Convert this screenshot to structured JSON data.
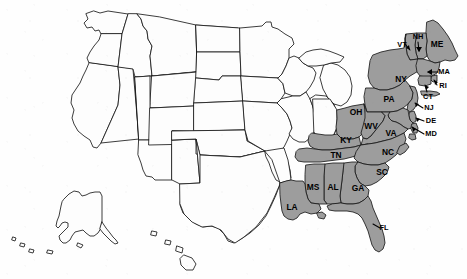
{
  "figure": {
    "kind": "us-states-choropleth-map",
    "width": 467,
    "height": 279,
    "background_color": "#fefefe",
    "shaded_fill_color": "#9d9d9d",
    "unshaded_fill_color": "#fdfdfd",
    "border_color": "#1a1a1a",
    "label_color": "#000000"
  },
  "chart_data": {
    "type": "map",
    "title": "",
    "subtitle": "",
    "xlabel": "",
    "ylabel": "",
    "legend": [],
    "categories": [
      "shaded",
      "unshaded"
    ],
    "shaded_count": 22,
    "labeled_states": [
      {
        "abbr": "ME",
        "label_x": 437,
        "label_y": 45,
        "value": 1
      },
      {
        "abbr": "NH",
        "label_x": 418,
        "label_y": 37,
        "value": 1
      },
      {
        "abbr": "VT",
        "label_x": 402,
        "label_y": 45,
        "value": 1
      },
      {
        "abbr": "MA",
        "label_x": 444,
        "label_y": 72,
        "value": 1
      },
      {
        "abbr": "RI",
        "label_x": 443,
        "label_y": 86,
        "value": 1
      },
      {
        "abbr": "CT",
        "label_x": 428,
        "label_y": 97,
        "value": 1
      },
      {
        "abbr": "NY",
        "label_x": 401,
        "label_y": 80,
        "value": 1
      },
      {
        "abbr": "NJ",
        "label_x": 429,
        "label_y": 108,
        "value": 1
      },
      {
        "abbr": "PA",
        "label_x": 389,
        "label_y": 100,
        "value": 1
      },
      {
        "abbr": "DE",
        "label_x": 431,
        "label_y": 121,
        "value": 1
      },
      {
        "abbr": "MD",
        "label_x": 431,
        "label_y": 134,
        "value": 1
      },
      {
        "abbr": "OH",
        "label_x": 356,
        "label_y": 113,
        "value": 1
      },
      {
        "abbr": "WV",
        "label_x": 371,
        "label_y": 127,
        "value": 1
      },
      {
        "abbr": "VA",
        "label_x": 391,
        "label_y": 134,
        "value": 1
      },
      {
        "abbr": "KY",
        "label_x": 346,
        "label_y": 141,
        "value": 1
      },
      {
        "abbr": "TN",
        "label_x": 336,
        "label_y": 156,
        "value": 1
      },
      {
        "abbr": "NC",
        "label_x": 388,
        "label_y": 153,
        "value": 1
      },
      {
        "abbr": "SC",
        "label_x": 382,
        "label_y": 173,
        "value": 1
      },
      {
        "abbr": "MS",
        "label_x": 313,
        "label_y": 188,
        "value": 1
      },
      {
        "abbr": "AL",
        "label_x": 333,
        "label_y": 188,
        "value": 1
      },
      {
        "abbr": "GA",
        "label_x": 358,
        "label_y": 189,
        "value": 1
      },
      {
        "abbr": "LA",
        "label_x": 292,
        "label_y": 208,
        "value": 1
      },
      {
        "abbr": "FL",
        "label_x": 384,
        "label_y": 228,
        "value": 1
      }
    ],
    "unlabeled_states": [
      "WA",
      "OR",
      "CA",
      "NV",
      "ID",
      "MT",
      "WY",
      "UT",
      "AZ",
      "CO",
      "NM",
      "ND",
      "SD",
      "NE",
      "KS",
      "OK",
      "TX",
      "MN",
      "IA",
      "MO",
      "AR",
      "WI",
      "IL",
      "MI",
      "IN",
      "AK",
      "HI"
    ]
  }
}
